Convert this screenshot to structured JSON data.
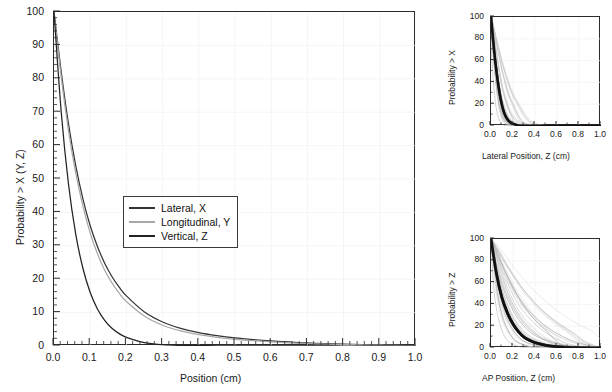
{
  "figure": {
    "panels": [
      "main",
      "top_right",
      "bottom_right"
    ]
  },
  "main": {
    "xlabel": "Position (cm)",
    "ylabel": "Probability > X (Y, Z)",
    "xticks": [
      "0.0",
      "0.1",
      "0.2",
      "0.3",
      "0.4",
      "0.5",
      "0.6",
      "0.7",
      "0.8",
      "0.9",
      "1.0"
    ],
    "yticks": [
      "0",
      "10",
      "20",
      "30",
      "40",
      "50",
      "60",
      "70",
      "80",
      "90",
      "100"
    ],
    "legend": [
      {
        "label": "Lateral, X",
        "color": "#333333"
      },
      {
        "label": "Longitudinal, Y",
        "color": "#a8a8a8"
      },
      {
        "label": "Vertical, Z",
        "color": "#222222"
      }
    ]
  },
  "top_right": {
    "xlabel": "Lateral Position, Z (cm)",
    "ylabel": "Probability > X",
    "xticks": [
      "0.0",
      "0.2",
      "0.4",
      "0.6",
      "0.8",
      "1.0"
    ],
    "yticks": [
      "0",
      "20",
      "40",
      "60",
      "80",
      "100"
    ]
  },
  "bottom_right": {
    "xlabel": "AP Position, Z (cm)",
    "ylabel": "Probability > Z",
    "xticks": [
      "0.0",
      "0.2",
      "0.4",
      "0.6",
      "0.8",
      "1.0"
    ],
    "yticks": [
      "0",
      "20",
      "40",
      "60",
      "80",
      "100"
    ]
  },
  "chart_data": [
    {
      "type": "line",
      "id": "main",
      "title": "",
      "xlabel": "Position (cm)",
      "ylabel": "Probability > X (Y, Z)",
      "xlim": [
        0.0,
        1.0
      ],
      "ylim": [
        0,
        100
      ],
      "xticks": [
        0.0,
        0.1,
        0.2,
        0.3,
        0.4,
        0.5,
        0.6,
        0.7,
        0.8,
        0.9,
        1.0
      ],
      "yticks": [
        0,
        10,
        20,
        30,
        40,
        50,
        60,
        70,
        80,
        90,
        100
      ],
      "grid": true,
      "legend_position": "center-left",
      "x": [
        0.0,
        0.02,
        0.04,
        0.06,
        0.08,
        0.1,
        0.12,
        0.14,
        0.16,
        0.18,
        0.2,
        0.25,
        0.3,
        0.35,
        0.4,
        0.45,
        0.5,
        0.55,
        0.6,
        0.65,
        0.7,
        0.75,
        0.8,
        0.85,
        0.9,
        0.95,
        1.0
      ],
      "series": [
        {
          "name": "Lateral, X",
          "color": "#333333",
          "values": [
            100,
            82.0,
            66.5,
            54.0,
            44.0,
            36.0,
            29.8,
            24.8,
            20.8,
            17.6,
            15.0,
            10.2,
            7.2,
            5.3,
            4.0,
            3.1,
            2.4,
            1.9,
            1.5,
            1.2,
            0.9,
            0.7,
            0.55,
            0.4,
            0.3,
            0.2,
            0.1
          ]
        },
        {
          "name": "Longitudinal, Y",
          "color": "#a8a8a8",
          "values": [
            100,
            80.5,
            64.5,
            51.8,
            41.8,
            33.8,
            27.6,
            22.7,
            18.9,
            15.8,
            13.3,
            8.9,
            6.2,
            4.5,
            3.4,
            2.6,
            2.0,
            1.6,
            1.25,
            0.95,
            0.75,
            0.6,
            0.45,
            0.33,
            0.24,
            0.16,
            0.1
          ]
        },
        {
          "name": "Vertical, Z",
          "color": "#222222",
          "values": [
            100,
            70.0,
            48.5,
            33.5,
            23.2,
            16.0,
            11.1,
            7.7,
            5.3,
            3.7,
            2.6,
            1.0,
            0.4,
            0.18,
            0.1,
            0.06,
            0.04,
            0.03,
            0.02,
            0.015,
            0.01,
            0.01,
            0.0,
            0.0,
            0.0,
            0.0,
            0.0
          ]
        }
      ]
    },
    {
      "type": "line",
      "id": "top_right",
      "title": "",
      "xlabel": "Lateral Position, Z (cm)",
      "ylabel": "Probability > X",
      "xlim": [
        0.0,
        1.0
      ],
      "ylim": [
        0,
        100
      ],
      "xticks": [
        0.0,
        0.2,
        0.4,
        0.6,
        0.8,
        1.0
      ],
      "yticks": [
        0,
        20,
        40,
        60,
        80,
        100
      ],
      "grid": true,
      "legend_position": "none",
      "description": "Bold mean curve with a bundle of thin light-grey individual-patient curves, all decaying to ~0 by 0.25-0.3 cm",
      "x": [
        0.0,
        0.02,
        0.04,
        0.06,
        0.08,
        0.1,
        0.12,
        0.15,
        0.18,
        0.2,
        0.25,
        0.3,
        0.4,
        0.5,
        0.6,
        0.8,
        1.0
      ],
      "series": [
        {
          "name": "mean",
          "color": "#111111",
          "width": "bold",
          "values": [
            100,
            78,
            58,
            42,
            29,
            19,
            12,
            6,
            3,
            2,
            0.5,
            0.2,
            0.05,
            0.0,
            0.0,
            0.0,
            0.0
          ]
        },
        {
          "name": "individual-fastest",
          "color": "#9a9a9a",
          "width": "thin",
          "values": [
            100,
            70,
            46,
            29,
            17,
            10,
            5.5,
            2,
            0.8,
            0.4,
            0.1,
            0.0,
            0.0,
            0.0,
            0.0,
            0.0,
            0.0
          ]
        },
        {
          "name": "individual-median",
          "color": "#9a9a9a",
          "width": "thin",
          "values": [
            100,
            82,
            64,
            49,
            36,
            26,
            18,
            10,
            5.5,
            4,
            1.2,
            0.4,
            0.05,
            0.0,
            0.0,
            0.0,
            0.0
          ]
        },
        {
          "name": "individual-slowest",
          "color": "#bdbdbd",
          "width": "thin",
          "values": [
            100,
            90,
            80,
            70,
            60,
            51,
            43,
            32,
            24,
            20,
            9,
            3,
            0.4,
            0.05,
            0.0,
            0.0,
            0.0
          ]
        }
      ]
    },
    {
      "type": "line",
      "id": "bottom_right",
      "title": "",
      "xlabel": "AP Position, Z (cm)",
      "ylabel": "Probability > Z",
      "xlim": [
        0.0,
        1.0
      ],
      "ylim": [
        0,
        100
      ],
      "xticks": [
        0.0,
        0.2,
        0.4,
        0.6,
        0.8,
        1.0
      ],
      "yticks": [
        0,
        20,
        40,
        60,
        80,
        100
      ],
      "grid": true,
      "legend_position": "none",
      "description": "Bold mean curve with a broad fan of thin light-grey individual-patient curves extending out to ~0.8 cm",
      "x": [
        0.0,
        0.05,
        0.1,
        0.15,
        0.2,
        0.25,
        0.3,
        0.35,
        0.4,
        0.5,
        0.6,
        0.7,
        0.8,
        0.9,
        1.0
      ],
      "series": [
        {
          "name": "mean",
          "color": "#111111",
          "width": "bold",
          "values": [
            100,
            68,
            46,
            32,
            22,
            15,
            10,
            7,
            5,
            2.5,
            1.2,
            0.6,
            0.3,
            0.1,
            0.0
          ]
        },
        {
          "name": "individual-fastest",
          "color": "#9a9a9a",
          "width": "thin",
          "values": [
            100,
            55,
            30,
            17,
            9,
            5,
            3,
            1.6,
            0.9,
            0.3,
            0.1,
            0.0,
            0.0,
            0.0,
            0.0
          ]
        },
        {
          "name": "individual-median",
          "color": "#9a9a9a",
          "width": "thin",
          "values": [
            100,
            74,
            54,
            40,
            29,
            21,
            15,
            11,
            8,
            4,
            2,
            1,
            0.4,
            0.1,
            0.0
          ]
        },
        {
          "name": "individual-slow",
          "color": "#b0b0b0",
          "width": "thin",
          "values": [
            100,
            86,
            72,
            60,
            49,
            40,
            33,
            27,
            22,
            14,
            8,
            4,
            1.5,
            0.4,
            0.0
          ]
        },
        {
          "name": "individual-slowest",
          "color": "#c4c4c4",
          "width": "thin",
          "values": [
            100,
            92,
            83,
            74,
            66,
            58,
            51,
            45,
            39,
            29,
            21,
            14,
            6,
            1.5,
            0.0
          ]
        }
      ]
    }
  ]
}
